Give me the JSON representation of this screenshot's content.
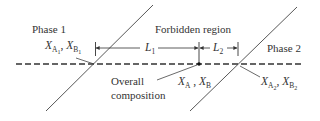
{
  "diagram": {
    "type": "phase-separation-lever-rule",
    "labels": {
      "phase1": "Phase 1",
      "phase2": "Phase 2",
      "forbidden_region": "Forbidden region",
      "overall_line1": "Overall",
      "overall_line2": "composition",
      "L1": {
        "base": "L",
        "sub": "1"
      },
      "L2": {
        "base": "L",
        "sub": "2"
      },
      "phase1_comp": {
        "xa": "X",
        "xa_sub": "A",
        "xa_subsub": "1",
        "sep": ", ",
        "xb": "X",
        "xb_sub": "B",
        "xb_subsub": "1"
      },
      "overall_comp": {
        "xa": "X",
        "xa_sub": "A",
        "sep": " , ",
        "xb": "X",
        "xb_sub": "B"
      },
      "phase2_comp": {
        "xa": "X",
        "xa_sub": "A",
        "xa_subsub": "2",
        "sep": ", ",
        "xb": "X",
        "xb_sub": "B",
        "xb_subsub": "2"
      }
    },
    "colors": {
      "line": "#333333",
      "text": "#333333",
      "background": "#ffffff"
    }
  }
}
